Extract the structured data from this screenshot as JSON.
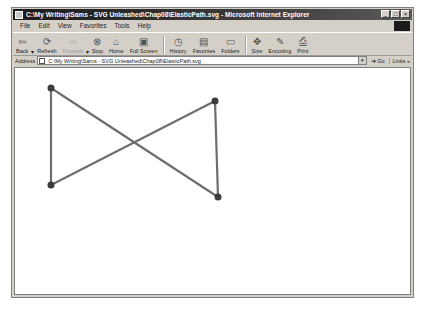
{
  "window": {
    "title": "C:\\My Writing\\Sams - SVG Unleashed\\Chap08\\ElasticPath.svg - Microsoft Internet Explorer",
    "controls": [
      "_",
      "□",
      "×"
    ]
  },
  "menu": {
    "items": [
      "File",
      "Edit",
      "View",
      "Favorites",
      "Tools",
      "Help"
    ]
  },
  "toolbar": {
    "buttons": [
      {
        "label": "Back",
        "icon": "back-arrow-icon",
        "glyph": "⇦",
        "dropdown": true,
        "disabled": false
      },
      {
        "label": "Refresh",
        "icon": "refresh-icon",
        "glyph": "⟳",
        "dropdown": false,
        "disabled": false
      },
      {
        "label": "Forward",
        "icon": "forward-arrow-icon",
        "glyph": "⇨",
        "dropdown": true,
        "disabled": true
      },
      {
        "label": "Stop",
        "icon": "stop-icon",
        "glyph": "⊗",
        "dropdown": false,
        "disabled": false
      },
      {
        "label": "Home",
        "icon": "home-icon",
        "glyph": "⌂",
        "dropdown": false,
        "disabled": false
      },
      {
        "label": "Full Screen",
        "icon": "fullscreen-icon",
        "glyph": "▣",
        "dropdown": false,
        "disabled": false
      },
      {
        "label": "History",
        "icon": "history-icon",
        "glyph": "◷",
        "dropdown": false,
        "disabled": false
      },
      {
        "label": "Favorites",
        "icon": "favorites-icon",
        "glyph": "▤",
        "dropdown": false,
        "disabled": false
      },
      {
        "label": "Folders",
        "icon": "folders-icon",
        "glyph": "▭",
        "dropdown": false,
        "disabled": false
      },
      {
        "label": "Size",
        "icon": "size-icon",
        "glyph": "✥",
        "dropdown": true,
        "disabled": false
      },
      {
        "label": "Encoding",
        "icon": "encoding-icon",
        "glyph": "✎",
        "dropdown": true,
        "disabled": false
      },
      {
        "label": "Print",
        "icon": "print-icon",
        "glyph": "⎙",
        "dropdown": false,
        "disabled": false
      }
    ]
  },
  "address": {
    "label": "Address",
    "value": "C:\\My Writing\\Sams - SVG Unleashed\\Chap08\\ElasticPath.svg",
    "go_label": "Go",
    "links_label": "Links »"
  },
  "drawing": {
    "stroke_color": "#6e6e6e",
    "dot_color": "#3c3c3c",
    "points": [
      {
        "name": "top-left",
        "x": 36,
        "y": 20
      },
      {
        "name": "bottom-left",
        "x": 36,
        "y": 117
      },
      {
        "name": "top-right",
        "x": 200,
        "y": 33
      },
      {
        "name": "bottom-right",
        "x": 203,
        "y": 129
      }
    ],
    "path_order": [
      "top-left",
      "bottom-left",
      "top-right",
      "bottom-right",
      "top-left"
    ]
  }
}
